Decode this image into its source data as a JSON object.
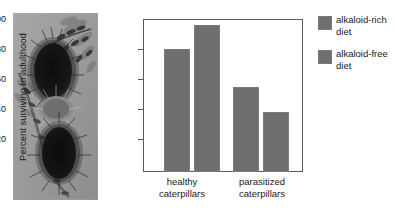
{
  "figure": {
    "photo": {
      "name": "caterpillar-photograph",
      "alt": "woolly bear caterpillar on plant stem"
    }
  },
  "chart_data": {
    "type": "bar",
    "title": "",
    "xlabel": "",
    "ylabel": "Percent surviving to adulthood",
    "ylim": [
      0,
      100
    ],
    "yticks": [
      20,
      40,
      60,
      80,
      100
    ],
    "grid": false,
    "legend_position": "right",
    "categories": [
      "healthy caterpillars",
      "parasitized caterpillars"
    ],
    "category_lines": [
      [
        "healthy",
        "caterpillars"
      ],
      [
        "parasitized",
        "caterpillars"
      ]
    ],
    "series": [
      {
        "name": "alkaloid-rich diet",
        "values": [
          82,
          57
        ],
        "color": "#6e6e6e"
      },
      {
        "name": "alkaloid-free diet",
        "values": [
          98,
          40
        ],
        "color": "#6e6e6e"
      }
    ]
  },
  "legend": {
    "items": [
      {
        "label_line1": "alkaloid-rich",
        "label_line2": "diet",
        "color": "#6e6e6e"
      },
      {
        "label_line1": "alkaloid-free",
        "label_line2": "diet",
        "color": "#6e6e6e"
      }
    ]
  }
}
